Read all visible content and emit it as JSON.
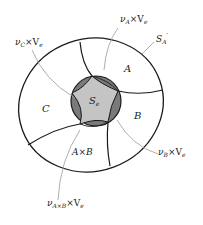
{
  "diagram": {
    "regions": {
      "center": {
        "main": "S",
        "sub": "e"
      },
      "A": "A",
      "B": "B",
      "C": "C",
      "AxB": "A×B"
    },
    "annotations": {
      "nuC": {
        "nu": "ν",
        "sub": "C",
        "rest": "×V",
        "rest_sub": "e"
      },
      "nuA": {
        "nu": "ν",
        "sub": "A",
        "rest": "×V",
        "rest_sub": "e"
      },
      "SA": {
        "main": "S",
        "sub": "A",
        "prime": "′"
      },
      "nuB": {
        "nu": "ν",
        "sub": "B",
        "rest": "×V",
        "rest_sub": "e"
      },
      "nuAxB": {
        "nu": "ν",
        "sub": "A×B",
        "rest": "×V",
        "rest_sub": "e"
      }
    },
    "colors": {
      "outline": "#1a1a1a",
      "leader": "#9a9a9a",
      "dark_fill": "#7a7a7a",
      "light_fill": "#c4c4c4",
      "background": "#ffffff"
    }
  }
}
